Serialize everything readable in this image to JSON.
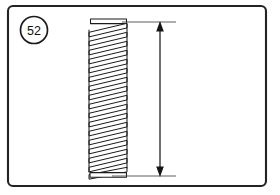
{
  "figure": {
    "kind": "technical-line-drawing",
    "background_color": "#ffffff",
    "line_color": "#1b1b1b",
    "frame": {
      "name": "figure-border",
      "x": 8,
      "y": 6,
      "width": 258,
      "height": 180,
      "corner_radius": 5,
      "stroke_color": "#232323",
      "stroke_width": 2.1
    },
    "callout": {
      "label": "52",
      "shape": "circle",
      "center_x": 34,
      "center_y": 30,
      "radius": 13.5,
      "stroke_color": "#1b1b1b",
      "text_color": "#111111"
    },
    "spring": {
      "name": "coil-spring",
      "left_x": 88,
      "right_x": 128,
      "top_y": 19,
      "bottom_y": 177,
      "coil_count": 17,
      "wire_thickness": 4.6,
      "closed_end_top": true,
      "closed_end_bottom": true,
      "wire_color": "#1b1b1b",
      "fill_color": "#ffffff"
    },
    "dimension": {
      "name": "overall-height-dimension",
      "label": "",
      "line_x": 160,
      "top_y": 22,
      "bottom_y": 176,
      "arrowhead_top": "up",
      "arrowhead_bottom": "down",
      "arrow_color": "#151515",
      "extension_lines": [
        {
          "name": "top-extension-line",
          "x1": 122,
          "y": 22,
          "x2": 176
        },
        {
          "name": "bottom-extension-line",
          "x1": 112,
          "y": 176,
          "x2": 176
        }
      ],
      "extension_color": "#4a4a4a"
    }
  }
}
